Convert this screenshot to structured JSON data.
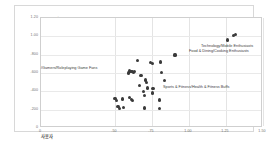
{
  "chart_data": {
    "type": "scatter",
    "title": "이용료 0",
    "xlabel": "사용자",
    "ylabel": "이용료 0",
    "xlim": [
      0,
      1.5
    ],
    "ylim": [
      0,
      1.2
    ],
    "grid": true,
    "legend": "none",
    "point_color": "#3a3a3a",
    "xticks": [
      "0",
      ".50",
      ".75",
      "1.00",
      "1.25",
      "1.50"
    ],
    "xtick_values": [
      0,
      0.5,
      0.75,
      1.0,
      1.25,
      1.5
    ],
    "yticks": [
      "1.20",
      "1.00",
      ".800",
      ".600",
      ".400",
      ".200",
      "0"
    ],
    "ytick_values": [
      1.2,
      1.0,
      0.8,
      0.6,
      0.4,
      0.2,
      0
    ],
    "points": [
      {
        "x": 1.3,
        "y": 1.012
      },
      {
        "x": 1.312,
        "y": 1.022
      },
      {
        "x": 1.258,
        "y": 0.96
      },
      {
        "x": 0.905,
        "y": 0.796
      },
      {
        "x": 0.65,
        "y": 0.74
      },
      {
        "x": 0.74,
        "y": 0.718
      },
      {
        "x": 0.755,
        "y": 0.7
      },
      {
        "x": 0.808,
        "y": 0.72
      },
      {
        "x": 0.6,
        "y": 0.622
      },
      {
        "x": 0.608,
        "y": 0.612
      },
      {
        "x": 0.618,
        "y": 0.618
      },
      {
        "x": 0.626,
        "y": 0.608
      },
      {
        "x": 0.634,
        "y": 0.614
      },
      {
        "x": 0.59,
        "y": 0.6
      },
      {
        "x": 0.812,
        "y": 0.606
      },
      {
        "x": 0.676,
        "y": 0.576
      },
      {
        "x": 0.836,
        "y": 0.52
      },
      {
        "x": 0.706,
        "y": 0.524
      },
      {
        "x": 0.712,
        "y": 0.498
      },
      {
        "x": 0.664,
        "y": 0.462
      },
      {
        "x": 0.72,
        "y": 0.436
      },
      {
        "x": 0.752,
        "y": 0.434
      },
      {
        "x": 0.76,
        "y": 0.428
      },
      {
        "x": 0.692,
        "y": 0.4
      },
      {
        "x": 0.752,
        "y": 0.382
      },
      {
        "x": 0.7,
        "y": 0.352
      },
      {
        "x": 0.5,
        "y": 0.318
      },
      {
        "x": 0.51,
        "y": 0.3
      },
      {
        "x": 0.548,
        "y": 0.316
      },
      {
        "x": 0.6,
        "y": 0.33
      },
      {
        "x": 0.61,
        "y": 0.31
      },
      {
        "x": 0.618,
        "y": 0.3
      },
      {
        "x": 0.8,
        "y": 0.306
      },
      {
        "x": 0.52,
        "y": 0.232
      },
      {
        "x": 0.528,
        "y": 0.212
      },
      {
        "x": 0.556,
        "y": 0.22
      },
      {
        "x": 0.7,
        "y": 0.218
      },
      {
        "x": 0.8,
        "y": 0.216
      }
    ],
    "annotations": [
      {
        "text": "Technology/Mobile Enthusiasts",
        "x_px": 186,
        "y_px": 38
      },
      {
        "text": "Food & Dining/Cooking Enthusiasts",
        "x_px": 174,
        "y_px": 43
      },
      {
        "text": "Sports & Fitness/Health & Fitness Buffs",
        "x_px": 148,
        "y_px": 79
      },
      {
        "text": "/Gamers/Roleplaying Game Fans",
        "x_px": 26,
        "y_px": 60
      }
    ]
  }
}
